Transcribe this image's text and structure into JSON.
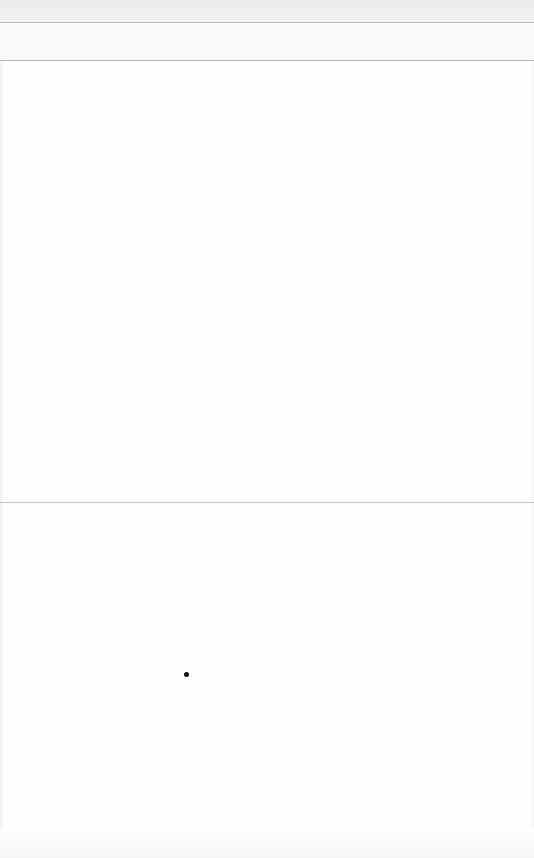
{
  "screen": {
    "description": "blank page",
    "background_color": "#fefefe",
    "header_band_color": "#ececec",
    "divider_color": "#c4c4c4"
  },
  "cursor": {
    "x": 186,
    "y": 675,
    "color": "#111111"
  }
}
